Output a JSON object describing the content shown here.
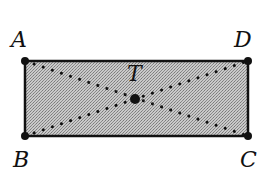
{
  "figure": {
    "shape": "rectangle",
    "fill_color": "#b8b8b8",
    "stroke_color": "#111111",
    "vertices": [
      {
        "name": "A",
        "x": 25,
        "y": 61,
        "label_x": 11,
        "label_y": 47
      },
      {
        "name": "D",
        "x": 248,
        "y": 61,
        "label_x": 234,
        "label_y": 47
      },
      {
        "name": "C",
        "x": 248,
        "y": 136,
        "label_x": 240,
        "label_y": 167
      },
      {
        "name": "B",
        "x": 25,
        "y": 136,
        "label_x": 13,
        "label_y": 167
      }
    ],
    "center": {
      "name": "T",
      "x": 135,
      "y": 99,
      "label_x": 127,
      "label_y": 81
    },
    "diagonals": [
      "AC",
      "BD"
    ],
    "diagonal_style": "dotted"
  }
}
